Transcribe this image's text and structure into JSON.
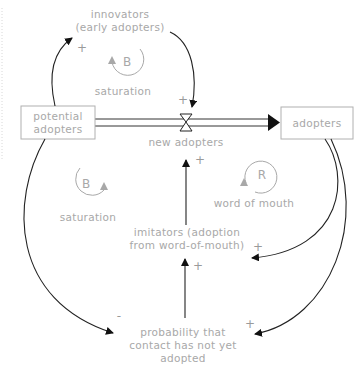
{
  "stocks": {
    "potential_adopters": {
      "line1": "potential",
      "line2": "adopters"
    },
    "adopters": {
      "label": "adopters"
    }
  },
  "flow": {
    "label": "new adopters"
  },
  "variables": {
    "innovators": {
      "line1": "innovators",
      "line2": "(early adopters)"
    },
    "imitators": {
      "line1": "imitators (adoption",
      "line2": "from word-of-mouth)"
    },
    "probability": {
      "line1": "probability that",
      "line2": "contact has not yet",
      "line3": "adopted"
    }
  },
  "loops": [
    {
      "type": "B",
      "name": "saturation",
      "position": "top"
    },
    {
      "type": "B",
      "name": "saturation",
      "position": "left"
    },
    {
      "type": "R",
      "name": "word of mouth",
      "position": "right"
    }
  ],
  "polarities": {
    "potential_to_innovators": "+",
    "innovators_to_flow": "+",
    "imitators_to_flow": "+",
    "adopters_to_imitators": "+",
    "probability_to_imitators": "+",
    "potential_to_probability": "-",
    "adopters_to_probability": "+"
  },
  "colors": {
    "text": "#a8a8a8",
    "links": "#222222",
    "box_border": "#b0b0b0"
  }
}
